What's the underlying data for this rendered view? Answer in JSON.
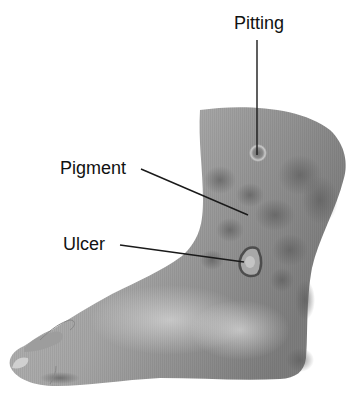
{
  "figure": {
    "labels": [
      {
        "id": "pitting",
        "text": "Pitting"
      },
      {
        "id": "pigment",
        "text": "Pigment"
      },
      {
        "id": "ulcer",
        "text": "Ulcer"
      }
    ]
  },
  "colors": {
    "background": "#ffffff",
    "skin_light": "#c8c8c8",
    "skin_mid": "#9a9a9a",
    "skin_dark": "#6a6a6a",
    "label_text": "#111111",
    "leader_line": "#1a1a1a"
  }
}
